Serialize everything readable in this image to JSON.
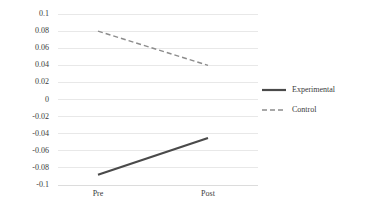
{
  "chart_data": {
    "type": "line",
    "title": "",
    "xlabel": "",
    "ylabel": "",
    "categories": [
      "Pre",
      "Post"
    ],
    "series": [
      {
        "name": "Experimental",
        "values": [
          -0.088,
          -0.045
        ],
        "style": "solid",
        "color": "#4a4a4a"
      },
      {
        "name": "Control",
        "values": [
          0.08,
          0.04
        ],
        "style": "dashed",
        "color": "#8c8c8c"
      }
    ],
    "ylim": [
      -0.1,
      0.1
    ],
    "ytick_step": 0.02,
    "ytick_labels": [
      "0.1",
      "0.08",
      "0.06",
      "0.04",
      "0.02",
      "0",
      "-0.02",
      "-0.04",
      "-0.06",
      "-0.08",
      "-0.1"
    ],
    "ytick_values": [
      0.1,
      0.08,
      0.06,
      0.04,
      0.02,
      0,
      -0.02,
      -0.04,
      -0.06,
      -0.08,
      -0.1
    ],
    "grid": true,
    "grid_axis": "y",
    "legend_position": "right",
    "legend": [
      {
        "label": "Experimental",
        "style": "solid",
        "color": "#4a4a4a"
      },
      {
        "label": "Control",
        "style": "dashed",
        "color": "#8c8c8c"
      }
    ]
  }
}
